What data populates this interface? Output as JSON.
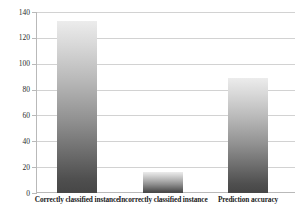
{
  "chart_data": {
    "type": "bar",
    "title": "",
    "subtitle": "",
    "xlabel": "",
    "ylabel": "",
    "categories": [
      "Correctly classified instance",
      "Incorrectly classified instance",
      "Prediction accuracy"
    ],
    "values": [
      133,
      16,
      89
    ],
    "ylim": [
      0,
      140
    ],
    "ytick_labels": [
      "0",
      "20",
      "40",
      "60",
      "80",
      "100",
      "120",
      "140"
    ],
    "ytick_values": [
      0,
      20,
      40,
      60,
      80,
      100,
      120,
      140
    ],
    "grid": true,
    "legend": false,
    "legend_position": "none",
    "bar_color_top": "#ececec",
    "bar_color_bottom": "#464646",
    "gridline_color": "#d2d2d2",
    "axis_color": "#b9b9b9",
    "background": "#ffffff"
  }
}
